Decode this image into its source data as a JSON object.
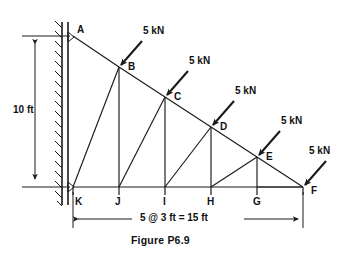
{
  "figure": {
    "caption": "Figure P6.9",
    "type": "cantilever-truss-free-body-diagram"
  },
  "geometry": {
    "height_dim": "10 ft",
    "span_dim": "5 @ 3 ft = 15 ft",
    "panels": 5,
    "panel_length_ft": 3,
    "span_ft": 15,
    "height_ft": 10
  },
  "joints": {
    "top_chord": [
      {
        "label": "A",
        "x": 73,
        "y": 36
      },
      {
        "label": "B",
        "x": 119,
        "y": 67
      },
      {
        "label": "C",
        "x": 165,
        "y": 97
      },
      {
        "label": "D",
        "x": 211,
        "y": 127
      },
      {
        "label": "E",
        "x": 257,
        "y": 157
      },
      {
        "label": "F",
        "x": 303,
        "y": 187
      }
    ],
    "bottom_chord": [
      {
        "label": "K",
        "x": 73,
        "y": 187
      },
      {
        "label": "J",
        "x": 119,
        "y": 187
      },
      {
        "label": "I",
        "x": 165,
        "y": 187
      },
      {
        "label": "H",
        "x": 211,
        "y": 187
      },
      {
        "label": "G",
        "x": 257,
        "y": 187
      },
      {
        "label": "F",
        "x": 303,
        "y": 187
      }
    ]
  },
  "members": {
    "verticals": [
      "B-J",
      "C-I",
      "D-H",
      "E-G"
    ],
    "diagonals": [
      "K-B",
      "J-C",
      "I-D",
      "H-E",
      "G-F"
    ],
    "top_chord": "A-B-C-D-E-F",
    "bottom_chord": "K-J-I-H-G-F"
  },
  "loads": [
    {
      "magnitude": "5 kN",
      "at_joint": "B",
      "label_x": 143,
      "label_y": 30
    },
    {
      "magnitude": "5 kN",
      "at_joint": "C",
      "label_x": 189,
      "label_y": 60
    },
    {
      "magnitude": "5 kN",
      "at_joint": "D",
      "label_x": 235,
      "label_y": 90
    },
    {
      "magnitude": "5 kN",
      "at_joint": "E",
      "label_x": 281,
      "label_y": 120
    },
    {
      "magnitude": "5 kN",
      "at_joint": "F",
      "label_x": 310,
      "label_y": 150
    }
  ],
  "support": {
    "type": "fixed-wall",
    "side": "left",
    "attached_joints": [
      "A",
      "K"
    ]
  },
  "colors": {
    "line": "#1a1a1a",
    "background": "#ffffff",
    "text": "#111111"
  }
}
